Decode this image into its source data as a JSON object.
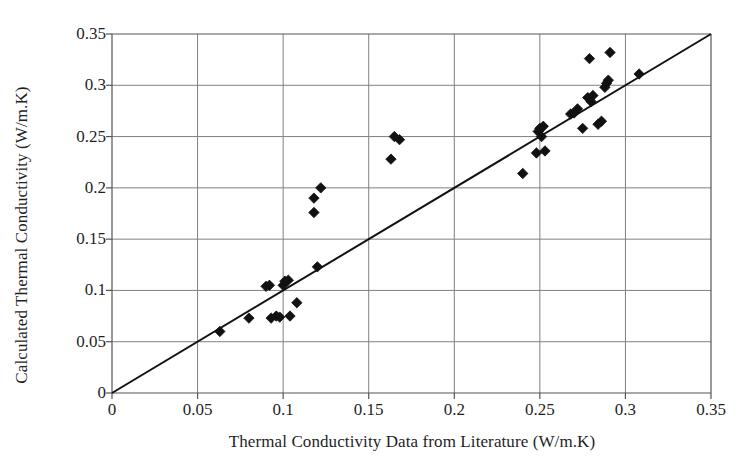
{
  "chart_data": {
    "type": "scatter",
    "title": "",
    "xlabel": "Thermal Conductivity Data from Literature (W/m.K)",
    "ylabel": "Calculated Thermal Conductivity (W/m.K)",
    "xlim": [
      0,
      0.35
    ],
    "ylim": [
      0,
      0.35
    ],
    "xticks": [
      "0",
      "0.05",
      "0.1",
      "0.15",
      "0.2",
      "0.25",
      "0.3",
      "0.35"
    ],
    "xtick_values": [
      0,
      0.05,
      0.1,
      0.15,
      0.2,
      0.25,
      0.3,
      0.35
    ],
    "yticks": [
      "0",
      "0.05",
      "0.1",
      "0.15",
      "0.2",
      "0.25",
      "0.3",
      "0.35"
    ],
    "ytick_values": [
      0,
      0.05,
      0.1,
      0.15,
      0.2,
      0.25,
      0.3,
      0.35
    ],
    "grid": true,
    "legend": null,
    "marker": "diamond",
    "marker_color": "#111111",
    "marker_size": 8,
    "grid_color": "#808080",
    "axis_color": "#555555",
    "reference_line": {
      "name": "parity-line",
      "from": [
        0,
        0
      ],
      "to": [
        0.35,
        0.35
      ],
      "color": "#111111",
      "width": 2
    },
    "series": [
      {
        "name": "Calculated vs Literature",
        "points": [
          [
            0.063,
            0.06
          ],
          [
            0.08,
            0.073
          ],
          [
            0.09,
            0.104
          ],
          [
            0.092,
            0.105
          ],
          [
            0.093,
            0.073
          ],
          [
            0.096,
            0.075
          ],
          [
            0.098,
            0.074
          ],
          [
            0.1,
            0.105
          ],
          [
            0.101,
            0.109
          ],
          [
            0.103,
            0.11
          ],
          [
            0.104,
            0.075
          ],
          [
            0.108,
            0.088
          ],
          [
            0.118,
            0.176
          ],
          [
            0.118,
            0.19
          ],
          [
            0.12,
            0.123
          ],
          [
            0.122,
            0.2
          ],
          [
            0.163,
            0.228
          ],
          [
            0.165,
            0.25
          ],
          [
            0.168,
            0.247
          ],
          [
            0.24,
            0.214
          ],
          [
            0.248,
            0.234
          ],
          [
            0.249,
            0.255
          ],
          [
            0.25,
            0.258
          ],
          [
            0.251,
            0.25
          ],
          [
            0.252,
            0.26
          ],
          [
            0.253,
            0.236
          ],
          [
            0.268,
            0.272
          ],
          [
            0.27,
            0.273
          ],
          [
            0.272,
            0.277
          ],
          [
            0.275,
            0.258
          ],
          [
            0.278,
            0.288
          ],
          [
            0.279,
            0.326
          ],
          [
            0.28,
            0.284
          ],
          [
            0.281,
            0.29
          ],
          [
            0.284,
            0.262
          ],
          [
            0.286,
            0.265
          ],
          [
            0.288,
            0.298
          ],
          [
            0.289,
            0.302
          ],
          [
            0.29,
            0.305
          ],
          [
            0.291,
            0.332
          ],
          [
            0.308,
            0.311
          ]
        ]
      }
    ]
  }
}
